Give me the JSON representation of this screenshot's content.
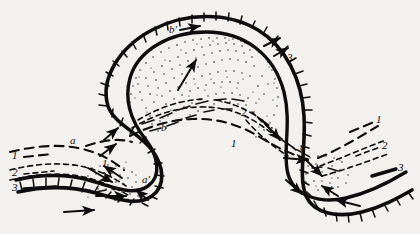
{
  "figure": {
    "name": "frontal-zone-schematic",
    "background_color": "#f3f1ed",
    "ink_color": "#0d0d0d"
  },
  "legend_left": {
    "items": [
      {
        "id": "left-1",
        "label": "1",
        "style": "long-dashed"
      },
      {
        "id": "left-2",
        "label": "2",
        "style": "short-dashed"
      },
      {
        "id": "left-3",
        "label": "3",
        "style": "solid-bold"
      }
    ]
  },
  "legend_right": {
    "items": [
      {
        "id": "right-1",
        "label": "1",
        "style": "long-dashed"
      },
      {
        "id": "right-2",
        "label": "2",
        "style": "short-dashed"
      },
      {
        "id": "right-3",
        "label": "3",
        "style": "solid-bold"
      }
    ]
  },
  "inline_labels": [
    {
      "id": "label-b-prime",
      "text": "b'",
      "x": 171,
      "y": 30
    },
    {
      "id": "label-3-top-right",
      "text": "3",
      "x": 289,
      "y": 58
    },
    {
      "id": "label-2-center",
      "text": "2",
      "x": 243,
      "y": 113
    },
    {
      "id": "label-b-center",
      "text": "b",
      "x": 163,
      "y": 128
    },
    {
      "id": "label-1-center",
      "text": "1",
      "x": 233,
      "y": 144
    },
    {
      "id": "label-a-left",
      "text": "a",
      "x": 72,
      "y": 141
    },
    {
      "id": "label-1-inner",
      "text": "1",
      "x": 104,
      "y": 164
    },
    {
      "id": "label-2-inner",
      "text": "2",
      "x": 106,
      "y": 179
    },
    {
      "id": "label-a-prime",
      "text": "a'",
      "x": 144,
      "y": 180
    },
    {
      "id": "label-c",
      "text": "c",
      "x": 302,
      "y": 148
    },
    {
      "id": "label-c-prime",
      "text": "c'",
      "x": 327,
      "y": 190
    }
  ],
  "legend_left_positions": [
    {
      "label": "1",
      "x": 17,
      "y": 158
    },
    {
      "label": "2",
      "x": 17,
      "y": 175
    },
    {
      "label": "3",
      "x": 17,
      "y": 190
    }
  ],
  "legend_right_positions": [
    {
      "label": "1",
      "x": 378,
      "y": 122
    },
    {
      "label": "2",
      "x": 383,
      "y": 148
    },
    {
      "label": "3",
      "x": 399,
      "y": 170
    }
  ],
  "curves": {
    "outer_front_label": "outer hachured front",
    "inner_front_label": "inner hachured front",
    "isoline_style_1": "long-dashed",
    "isoline_style_2": "short-dashed"
  }
}
